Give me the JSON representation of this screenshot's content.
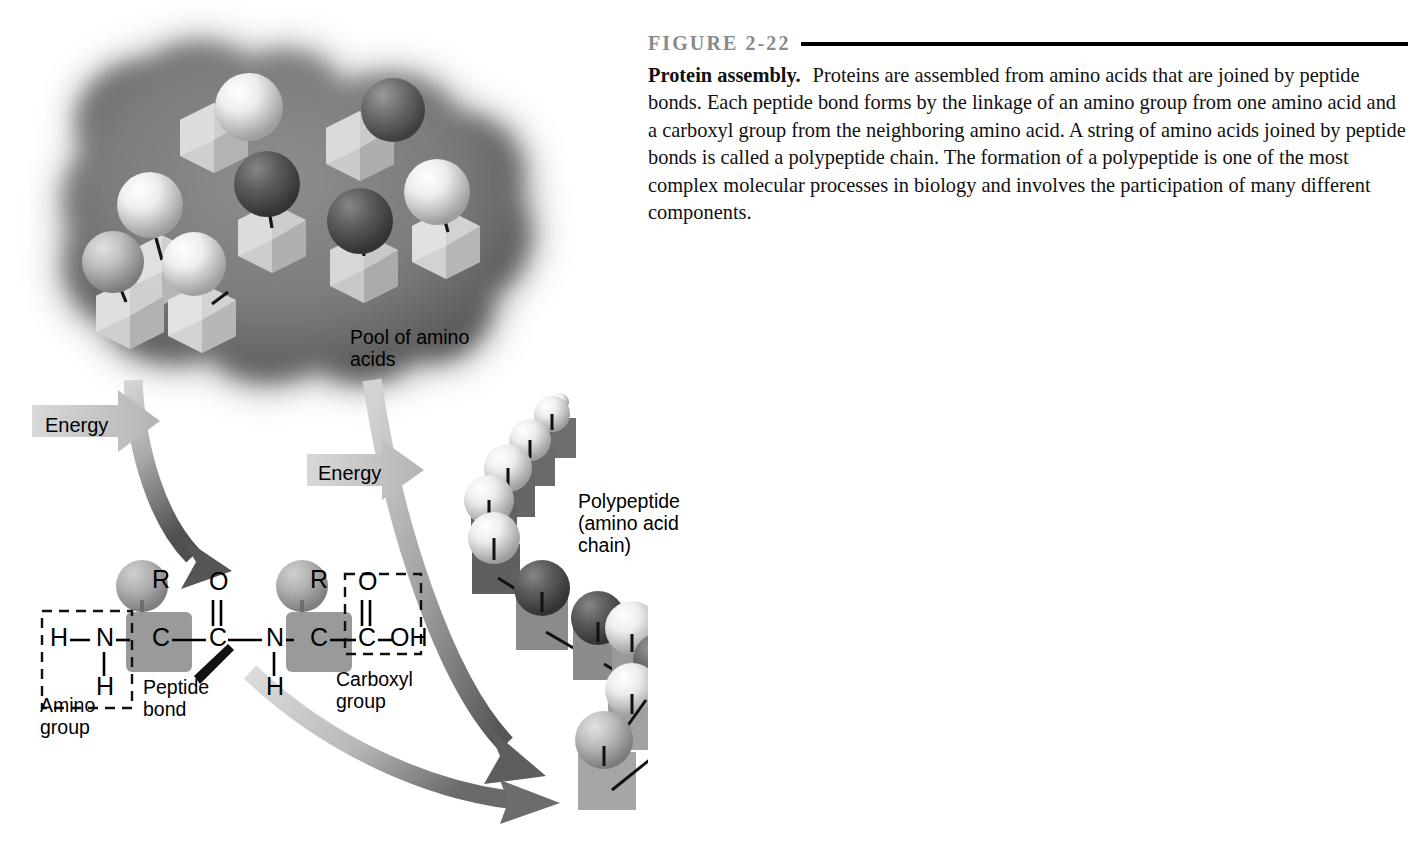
{
  "figure": {
    "number_label": "FIGURE 2-22",
    "title": "Protein assembly.",
    "caption": "Proteins are assembled from amino acids that are joined by peptide bonds. Each peptide bond forms by the linkage of an amino group from one amino acid and a carboxyl group from the neighboring amino acid. A string of amino acids joined by peptide bonds is called a polypeptide chain. The formation of a polypeptide is one of the most complex molecular processes in biology and involves the participation of many different components."
  },
  "diagram": {
    "labels": {
      "pool": "Pool of amino\nacids",
      "polypeptide": "Polypeptide\n(amino acid\nchain)",
      "energy_1": "Energy",
      "energy_2": "Energy",
      "amino_group": "Amino\ngroup",
      "peptide_bond": "Peptide\nbond",
      "carboxyl_group": "Carboxyl\ngroup"
    },
    "chemical_structure": {
      "description": "Dipeptide skeletal formula showing two amino acid residues joined by a peptide bond",
      "atoms": [
        {
          "id": "h-n-left",
          "text": "H",
          "x": 58,
          "y": 639
        },
        {
          "id": "n-left",
          "text": "N",
          "x": 104,
          "y": 639
        },
        {
          "id": "h-n-below",
          "text": "H",
          "x": 104,
          "y": 688
        },
        {
          "id": "c-alpha-1",
          "text": "C",
          "x": 160,
          "y": 639
        },
        {
          "id": "r-1",
          "text": "R",
          "x": 160,
          "y": 581
        },
        {
          "id": "o-carbonyl",
          "text": "O",
          "x": 217,
          "y": 583
        },
        {
          "id": "c-carbonyl",
          "text": "C",
          "x": 217,
          "y": 639
        },
        {
          "id": "n-amide",
          "text": "N",
          "x": 274,
          "y": 639
        },
        {
          "id": "h-amide",
          "text": "H",
          "x": 274,
          "y": 688
        },
        {
          "id": "c-alpha-2",
          "text": "C",
          "x": 318,
          "y": 639
        },
        {
          "id": "r-2",
          "text": "R",
          "x": 318,
          "y": 581
        },
        {
          "id": "o-acid",
          "text": "O",
          "x": 366,
          "y": 583
        },
        {
          "id": "c-acid",
          "text": "C",
          "x": 366,
          "y": 639
        },
        {
          "id": "oh-acid",
          "text": "OH",
          "x": 406,
          "y": 639
        }
      ],
      "dashed_boxes": [
        {
          "id": "amino-group-box",
          "x": 42,
          "y": 611,
          "w": 90,
          "h": 97
        },
        {
          "id": "carboxyl-group-box",
          "x": 345,
          "y": 574,
          "w": 76,
          "h": 80
        }
      ]
    },
    "pool_units": [
      {
        "cube_shade": "#d9d9d9",
        "sphere_shade": "#f4f4f4",
        "cx": 126,
        "cy": 138
      },
      {
        "cube_shade": "#cfcfcf",
        "sphere_shade": "#fafafa",
        "cx": 237,
        "cy": 110
      },
      {
        "cube_shade": "#d2d2d2",
        "sphere_shade": "#6e6e6e",
        "cx": 379,
        "cy": 130
      },
      {
        "cube_shade": "#c9c9c9",
        "sphere_shade": "#5f5f5f",
        "cx": 268,
        "cy": 188
      },
      {
        "cube_shade": "#d6d6d6",
        "sphere_shade": "#f2f2f2",
        "cx": 442,
        "cy": 200
      },
      {
        "cube_shade": "#cccccc",
        "sphere_shade": "#5a5a5a",
        "cx": 352,
        "cy": 230
      },
      {
        "cube_shade": "#d0d0d0",
        "sphere_shade": "#8f8f8f",
        "cx": 113,
        "cy": 258
      },
      {
        "cube_shade": "#d4d4d4",
        "sphere_shade": "#c6c6c6",
        "cx": 192,
        "cy": 258
      }
    ],
    "polypeptide_units": [
      {
        "cube_shade": "#6f6f6f",
        "sphere_shade": "#f2f2f2",
        "cx": 560,
        "cy": 406
      },
      {
        "cube_shade": "#6b6b6b",
        "sphere_shade": "#ededed",
        "cx": 540,
        "cy": 432
      },
      {
        "cube_shade": "#686868",
        "sphere_shade": "#e8e8e8",
        "cx": 520,
        "cy": 460
      },
      {
        "cube_shade": "#646464",
        "sphere_shade": "#e6e6e6",
        "cx": 500,
        "cy": 492
      },
      {
        "cube_shade": "#606060",
        "sphere_shade": "#e4e4e4",
        "cx": 487,
        "cy": 530
      },
      {
        "cube_shade": "#8a8a8a",
        "sphere_shade": "#5b5b5b",
        "cx": 540,
        "cy": 592
      },
      {
        "cube_shade": "#8a8a8a",
        "sphere_shade": "#5d5d5d",
        "cx": 597,
        "cy": 620
      },
      {
        "cube_shade": "#9a9a9a",
        "sphere_shade": "#e8e8e8",
        "cx": 645,
        "cy": 637
      },
      {
        "cube_shade": "#9a9a9a",
        "sphere_shade": "#6a6a6a",
        "cx": 655,
        "cy": 660
      },
      {
        "cube_shade": "#a0a0a0",
        "sphere_shade": "#dcdcdc",
        "cx": 640,
        "cy": 706
      },
      {
        "cube_shade": "#a6a6a6",
        "sphere_shade": "#8d8d8d",
        "cx": 590,
        "cy": 760
      }
    ]
  },
  "colors": {
    "rule": "#000000",
    "fig_label": "#8a8a8a",
    "pool_blob": "#6e6e6e",
    "arrow_light": "#c9c9c9",
    "arrow_dark": "#5a5a5a",
    "chem_box": "#8c8c8c"
  }
}
